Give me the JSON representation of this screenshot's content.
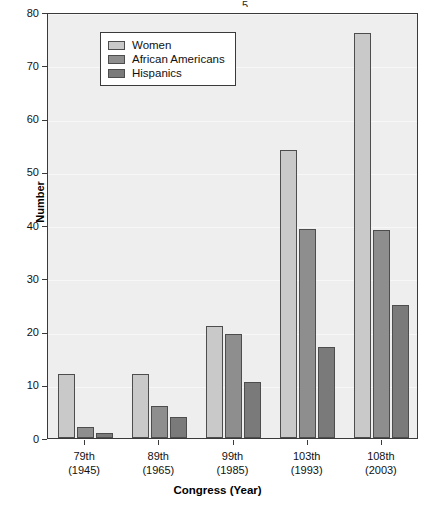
{
  "chart_data": {
    "type": "bar",
    "title": "",
    "subtitle": "",
    "xlabel": "Congress (Year)",
    "ylabel": "Number",
    "categories": [
      "79th",
      "89th",
      "99th",
      "103th",
      "108th"
    ],
    "category_years": [
      "(1945)",
      "(1965)",
      "(1985)",
      "(1993)",
      "(2003)"
    ],
    "category_labels": [
      "79th (1945)",
      "89th (1965)",
      "99th (1985)",
      "103th (1993)",
      "108th (2003)"
    ],
    "series": [
      {
        "name": "Women",
        "color": "#c9c9c9",
        "values": [
          12,
          12,
          21,
          54,
          76
        ]
      },
      {
        "name": "African Americans",
        "color": "#8e8e8e",
        "values": [
          2,
          6,
          19.5,
          39.3,
          39
        ]
      },
      {
        "name": "Hispanics",
        "color": "#7a7a7a",
        "values": [
          1,
          4,
          10.5,
          17,
          25
        ]
      }
    ],
    "ylim": [
      0,
      80
    ],
    "yticks": [
      0,
      10,
      20,
      30,
      40,
      50,
      60,
      70,
      80
    ],
    "ytick_labels": [
      "0",
      "10",
      "20",
      "30",
      "40",
      "50",
      "60",
      "70",
      "80"
    ],
    "grid": true,
    "grid_axis": "y",
    "legend_position": "top-left",
    "plot_background": "#eeeeee",
    "bar_edge_color": "#4d4d4d",
    "axis_color": "#3a3a3a"
  },
  "legend": {
    "items": [
      {
        "label": "Women"
      },
      {
        "label": "African Americans"
      },
      {
        "label": "Hispanics"
      }
    ]
  },
  "artifacts": {
    "top_fragment": "5"
  }
}
